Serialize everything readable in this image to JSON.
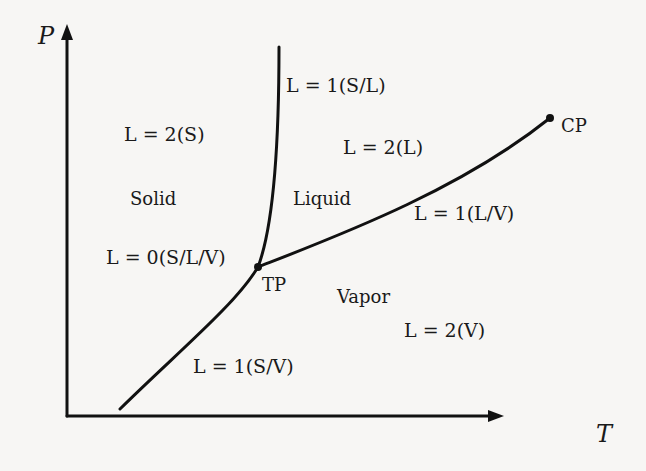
{
  "diagram": {
    "type": "phase-diagram",
    "axes": {
      "x_label": "T",
      "y_label": "P"
    },
    "regions": [
      {
        "name": "Solid",
        "count_label": "L = 2(S)"
      },
      {
        "name": "Liquid",
        "count_label": "L = 2(L)"
      },
      {
        "name": "Vapor",
        "count_label": "L = 2(V)"
      }
    ],
    "curves": [
      {
        "name": "melting",
        "label": "L = 1(S/L)"
      },
      {
        "name": "vaporization",
        "label": "L = 1(L/V)"
      },
      {
        "name": "sublimation",
        "label": "L = 1(S/V)"
      }
    ],
    "points": [
      {
        "name": "triple-point",
        "label": "TP",
        "count_label": "L = 0(S/L/V)"
      },
      {
        "name": "critical-point",
        "label": "CP"
      }
    ],
    "colors": {
      "line": "#111111",
      "background": "#f7f6f4"
    }
  }
}
